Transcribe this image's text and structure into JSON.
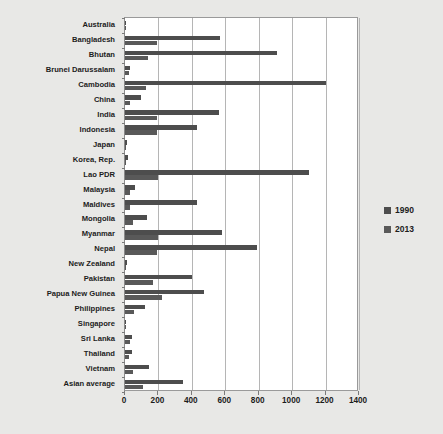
{
  "chart_data": {
    "type": "bar",
    "orientation": "horizontal",
    "title": "",
    "subtitle": "",
    "xlabel": "",
    "ylabel": "",
    "xlim": [
      0,
      1400
    ],
    "xticks": [
      0,
      200,
      400,
      600,
      800,
      1000,
      1200,
      1400
    ],
    "xtick_labels": [
      "0",
      "200",
      "400",
      "600",
      "800",
      "1000",
      "1200",
      "1400"
    ],
    "grid": true,
    "grid_axis": "x",
    "legend_position": "right",
    "categories": [
      "Australia",
      "Bangladesh",
      "Bhutan",
      "Brunei Darussalam",
      "Cambodia",
      "China",
      "India",
      "Indonesia",
      "Japan",
      "Korea, Rep.",
      "Lao PDR",
      "Malaysia",
      "Maldives",
      "Mongolia",
      "Myanmar",
      "Nepal",
      "New Zealand",
      "Pakistan",
      "Papua New Guinea",
      "Philippines",
      "Singapore",
      "Sri Lanka",
      "Thailand",
      "Vietnam",
      "Asian average"
    ],
    "series": [
      {
        "name": "1990",
        "color": "#4d4d4d",
        "values": [
          8,
          569,
          910,
          28,
          1200,
          97,
          560,
          430,
          14,
          18,
          1100,
          57,
          430,
          130,
          580,
          790,
          13,
          400,
          470,
          120,
          8,
          41,
          40,
          145,
          345
        ]
      },
      {
        "name": "2013",
        "color": "#595959",
        "values": [
          6,
          190,
          140,
          23,
          125,
          32,
          190,
          190,
          6,
          8,
          200,
          30,
          32,
          45,
          200,
          190,
          8,
          170,
          220,
          55,
          6,
          29,
          26,
          49,
          105
        ]
      }
    ]
  },
  "legend": {
    "items": [
      {
        "label": "1990",
        "color": "#4d4d4d"
      },
      {
        "label": "2013",
        "color": "#595959"
      }
    ]
  }
}
